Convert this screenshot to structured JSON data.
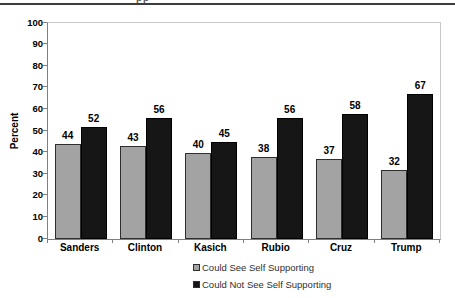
{
  "header": {
    "clipped_fragment": "pp"
  },
  "chart_data": {
    "type": "bar",
    "title": "",
    "xlabel": "",
    "ylabel": "Percent",
    "ylim": [
      0,
      100
    ],
    "ytick_step": 10,
    "grid": false,
    "legend_position": "bottom",
    "categories": [
      "Sanders",
      "Clinton",
      "Kasich",
      "Rubio",
      "Cruz",
      "Trump"
    ],
    "series": [
      {
        "name": "Could See Self Supporting",
        "color": "#a3a3a3",
        "values": [
          44,
          43,
          40,
          38,
          37,
          32
        ]
      },
      {
        "name": "Could Not See Self Supporting",
        "color": "#161616",
        "values": [
          52,
          56,
          45,
          56,
          58,
          67
        ]
      }
    ]
  }
}
